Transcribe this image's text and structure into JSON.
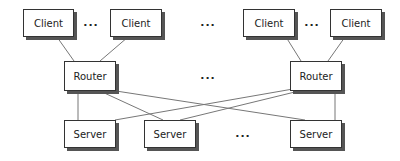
{
  "diagram": {
    "title": "",
    "nodes": [
      {
        "id": "client1",
        "label": "Client",
        "kind": "client",
        "x": 23,
        "y": 9,
        "w": 51,
        "h": 28
      },
      {
        "id": "client2",
        "label": "Client",
        "kind": "client",
        "x": 110,
        "y": 9,
        "w": 52,
        "h": 28
      },
      {
        "id": "client3",
        "label": "Client",
        "kind": "client",
        "x": 243,
        "y": 9,
        "w": 52,
        "h": 28
      },
      {
        "id": "client4",
        "label": "Client",
        "kind": "client",
        "x": 330,
        "y": 9,
        "w": 52,
        "h": 28
      },
      {
        "id": "router1",
        "label": "Router",
        "kind": "router",
        "x": 64,
        "y": 61,
        "w": 52,
        "h": 30
      },
      {
        "id": "router2",
        "label": "Router",
        "kind": "router",
        "x": 290,
        "y": 61,
        "w": 52,
        "h": 30
      },
      {
        "id": "server1",
        "label": "Server",
        "kind": "server",
        "x": 64,
        "y": 120,
        "w": 52,
        "h": 28
      },
      {
        "id": "server2",
        "label": "Server",
        "kind": "server",
        "x": 144,
        "y": 120,
        "w": 52,
        "h": 28
      },
      {
        "id": "server3",
        "label": "Server",
        "kind": "server",
        "x": 290,
        "y": 120,
        "w": 52,
        "h": 28
      }
    ],
    "ellipses": [
      {
        "id": "dots-clients-left",
        "label": "...",
        "x": 91,
        "y": 22
      },
      {
        "id": "dots-clients-middle",
        "label": "...",
        "x": 208,
        "y": 22
      },
      {
        "id": "dots-clients-right",
        "label": "...",
        "x": 312,
        "y": 22
      },
      {
        "id": "dots-routers",
        "label": "...",
        "x": 208,
        "y": 75
      },
      {
        "id": "dots-servers",
        "label": "...",
        "x": 243,
        "y": 133
      }
    ],
    "edges": [
      {
        "from": "client1",
        "to": "router1"
      },
      {
        "from": "client2",
        "to": "router1"
      },
      {
        "from": "client3",
        "to": "router2"
      },
      {
        "from": "client4",
        "to": "router2"
      },
      {
        "from": "router1",
        "to": "server1"
      },
      {
        "from": "router1",
        "to": "server2"
      },
      {
        "from": "router1",
        "to": "server3"
      },
      {
        "from": "router2",
        "to": "server1"
      },
      {
        "from": "router2",
        "to": "server2"
      },
      {
        "from": "router2",
        "to": "server3"
      }
    ],
    "colors": {
      "line": "#777777",
      "border": "#333333",
      "shadow": "#555555",
      "text": "#222222"
    }
  }
}
